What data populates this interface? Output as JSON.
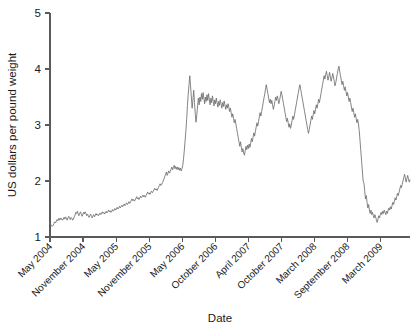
{
  "chart_data": {
    "type": "line",
    "title": "",
    "xlabel": "Date",
    "ylabel": "US dollars per pound weight",
    "ylim": [
      1,
      5
    ],
    "yticks": [
      1,
      2,
      3,
      4,
      5
    ],
    "ytick_labels": [
      "1",
      "2",
      "3",
      "4",
      "5"
    ],
    "grid": false,
    "legend": "none",
    "line_color": "#6e6e6e",
    "axis_color": "#5a5a5a",
    "xtick_labels": [
      "May 2004",
      "November 2004",
      "May 2005",
      "November 2005",
      "May 2006",
      "October 2006",
      "April 2007",
      "October 2007",
      "March 2008",
      "September 2008",
      "March 2009"
    ],
    "x_range_label": [
      "May 2004",
      "May 2009"
    ],
    "series": [
      {
        "name": "US dollars per pound weight",
        "color": "#6e6e6e",
        "values": [
          1.25,
          1.22,
          1.2,
          1.19,
          1.21,
          1.24,
          1.27,
          1.25,
          1.28,
          1.31,
          1.29,
          1.33,
          1.3,
          1.34,
          1.31,
          1.33,
          1.3,
          1.32,
          1.35,
          1.32,
          1.36,
          1.33,
          1.3,
          1.34,
          1.37,
          1.33,
          1.31,
          1.35,
          1.33,
          1.3,
          1.32,
          1.36,
          1.39,
          1.44,
          1.42,
          1.46,
          1.41,
          1.38,
          1.42,
          1.45,
          1.41,
          1.37,
          1.4,
          1.44,
          1.41,
          1.45,
          1.42,
          1.38,
          1.41,
          1.38,
          1.35,
          1.38,
          1.41,
          1.37,
          1.34,
          1.37,
          1.4,
          1.36,
          1.39,
          1.42,
          1.39,
          1.41,
          1.38,
          1.4,
          1.43,
          1.4,
          1.42,
          1.45,
          1.42,
          1.44,
          1.41,
          1.43,
          1.46,
          1.43,
          1.45,
          1.48,
          1.45,
          1.47,
          1.44,
          1.46,
          1.49,
          1.46,
          1.48,
          1.51,
          1.48,
          1.5,
          1.53,
          1.5,
          1.52,
          1.55,
          1.52,
          1.54,
          1.57,
          1.54,
          1.56,
          1.59,
          1.56,
          1.58,
          1.61,
          1.58,
          1.6,
          1.63,
          1.6,
          1.62,
          1.65,
          1.68,
          1.65,
          1.67,
          1.64,
          1.66,
          1.69,
          1.72,
          1.68,
          1.7,
          1.67,
          1.7,
          1.73,
          1.7,
          1.72,
          1.75,
          1.72,
          1.74,
          1.71,
          1.74,
          1.77,
          1.8,
          1.77,
          1.79,
          1.76,
          1.79,
          1.82,
          1.79,
          1.81,
          1.84,
          1.87,
          1.84,
          1.86,
          1.83,
          1.86,
          1.89,
          1.92,
          1.95,
          1.92,
          1.94,
          1.97,
          2.0,
          2.04,
          2.08,
          2.12,
          2.16,
          2.1,
          2.14,
          2.18,
          2.14,
          2.17,
          2.21,
          2.25,
          2.2,
          2.24,
          2.28,
          2.22,
          2.26,
          2.21,
          2.25,
          2.2,
          2.24,
          2.19,
          2.23,
          2.18,
          2.22,
          2.28,
          2.4,
          2.55,
          2.72,
          2.9,
          3.1,
          3.35,
          3.55,
          3.72,
          3.88,
          3.7,
          3.5,
          3.3,
          3.45,
          3.62,
          3.4,
          3.2,
          3.05,
          3.18,
          3.34,
          3.48,
          3.36,
          3.5,
          3.42,
          3.56,
          3.46,
          3.58,
          3.48,
          3.38,
          3.5,
          3.42,
          3.54,
          3.44,
          3.56,
          3.46,
          3.36,
          3.48,
          3.4,
          3.52,
          3.42,
          3.34,
          3.45,
          3.38,
          3.48,
          3.4,
          3.32,
          3.42,
          3.35,
          3.45,
          3.38,
          3.3,
          3.4,
          3.33,
          3.43,
          3.36,
          3.28,
          3.36,
          3.3,
          3.38,
          3.32,
          3.24,
          3.3,
          3.22,
          3.14,
          3.2,
          3.12,
          3.04,
          3.1,
          3.02,
          2.94,
          2.86,
          2.78,
          2.7,
          2.62,
          2.7,
          2.6,
          2.52,
          2.58,
          2.5,
          2.46,
          2.54,
          2.62,
          2.56,
          2.64,
          2.58,
          2.66,
          2.6,
          2.68,
          2.76,
          2.7,
          2.78,
          2.86,
          2.8,
          2.88,
          2.96,
          3.04,
          2.98,
          3.06,
          3.14,
          3.22,
          3.16,
          3.24,
          3.32,
          3.4,
          3.48,
          3.56,
          3.64,
          3.72,
          3.64,
          3.56,
          3.48,
          3.4,
          3.46,
          3.38,
          3.44,
          3.36,
          3.28,
          3.34,
          3.42,
          3.5,
          3.44,
          3.52,
          3.46,
          3.38,
          3.44,
          3.52,
          3.6,
          3.54,
          3.46,
          3.38,
          3.3,
          3.22,
          3.14,
          3.06,
          3.12,
          3.04,
          2.96,
          3.02,
          2.94,
          3.0,
          3.08,
          3.16,
          3.1,
          3.18,
          3.26,
          3.34,
          3.42,
          3.5,
          3.58,
          3.66,
          3.72,
          3.64,
          3.56,
          3.48,
          3.4,
          3.32,
          3.24,
          3.16,
          3.08,
          3.0,
          2.92,
          2.85,
          2.92,
          3.0,
          3.08,
          3.16,
          3.1,
          3.18,
          3.26,
          3.2,
          3.28,
          3.36,
          3.3,
          3.38,
          3.46,
          3.4,
          3.48,
          3.56,
          3.64,
          3.72,
          3.8,
          3.88,
          3.82,
          3.9,
          3.96,
          3.88,
          3.8,
          3.86,
          3.94,
          3.86,
          3.78,
          3.84,
          3.92,
          3.86,
          3.78,
          3.7,
          3.76,
          3.84,
          3.92,
          4.0,
          4.05,
          3.96,
          3.88,
          3.8,
          3.72,
          3.78,
          3.7,
          3.62,
          3.68,
          3.6,
          3.52,
          3.58,
          3.5,
          3.42,
          3.48,
          3.4,
          3.32,
          3.24,
          3.3,
          3.22,
          3.14,
          3.2,
          3.12,
          3.04,
          3.1,
          3.02,
          2.9,
          2.72,
          2.54,
          2.36,
          2.18,
          2.0,
          1.96,
          1.82,
          1.68,
          1.74,
          1.62,
          1.52,
          1.58,
          1.48,
          1.42,
          1.48,
          1.4,
          1.44,
          1.38,
          1.34,
          1.4,
          1.36,
          1.3,
          1.26,
          1.32,
          1.38,
          1.34,
          1.4,
          1.44,
          1.4,
          1.46,
          1.42,
          1.48,
          1.44,
          1.4,
          1.46,
          1.42,
          1.48,
          1.52,
          1.48,
          1.54,
          1.5,
          1.56,
          1.62,
          1.58,
          1.64,
          1.7,
          1.66,
          1.72,
          1.78,
          1.74,
          1.8,
          1.86,
          1.92,
          1.88,
          1.94,
          2.0,
          2.06,
          2.12,
          2.06,
          1.98,
          2.04,
          2.1,
          2.04,
          1.98,
          2.02
        ]
      }
    ]
  }
}
